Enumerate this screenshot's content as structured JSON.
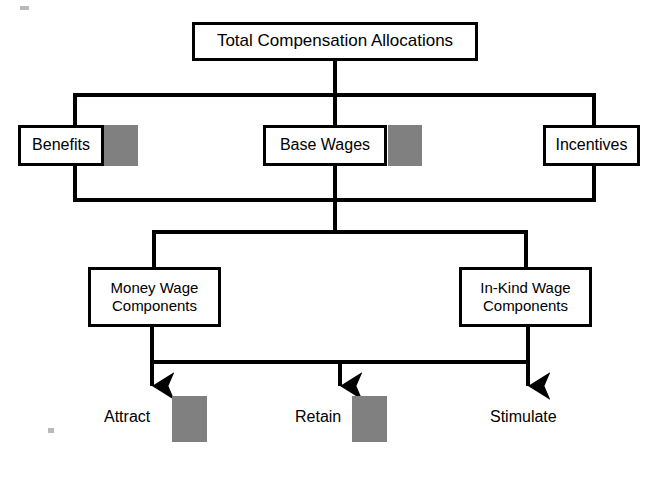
{
  "diagram": {
    "title": "Total Compensation Allocations",
    "type": "organizational-tree",
    "colors": {
      "line": "#000000",
      "box_fill": "#ffffff",
      "box_border": "#000000",
      "swatch_gray": "#808080",
      "page_background": "#ffffff"
    },
    "levels": [
      {
        "level": 1,
        "nodes": [
          {
            "id": "total-compensation-allocations",
            "label": "Total Compensation Allocations",
            "swatch": false,
            "x": 192,
            "y": 22,
            "w": 286,
            "h": 39,
            "font_size": 17
          }
        ]
      },
      {
        "level": 2,
        "nodes": [
          {
            "id": "benefits",
            "label": "Benefits",
            "swatch": true,
            "x": 18,
            "y": 125,
            "w": 86,
            "h": 41,
            "swatch_x": 104,
            "swatch_y": 125,
            "swatch_w": 34,
            "swatch_h": 41,
            "font_size": 16
          },
          {
            "id": "base-wages",
            "label": "Base Wages",
            "swatch": true,
            "x": 263,
            "y": 125,
            "w": 124,
            "h": 41,
            "swatch_x": 388,
            "swatch_y": 125,
            "swatch_w": 34,
            "swatch_h": 41,
            "font_size": 16
          },
          {
            "id": "incentives",
            "label": "Incentives",
            "swatch": false,
            "x": 543,
            "y": 125,
            "w": 97,
            "h": 41,
            "font_size": 16
          }
        ]
      },
      {
        "level": 3,
        "nodes": [
          {
            "id": "money-wage-components",
            "label": "Money Wage\nComponents",
            "swatch": false,
            "x": 88,
            "y": 267,
            "w": 133,
            "h": 60,
            "font_size": 15
          },
          {
            "id": "in-kind-wage-components",
            "label": "In-Kind Wage\nComponents",
            "swatch": false,
            "x": 459,
            "y": 267,
            "w": 133,
            "h": 60,
            "font_size": 15
          }
        ]
      }
    ],
    "outcomes": [
      {
        "id": "attract",
        "label": "Attract",
        "swatch": true,
        "label_x": 104,
        "label_y": 408,
        "swatch_x": 172,
        "swatch_y": 396,
        "swatch_w": 35,
        "swatch_h": 46,
        "arrow_x": 152,
        "font_size": 16
      },
      {
        "id": "retain",
        "label": "Retain",
        "swatch": true,
        "label_x": 295,
        "label_y": 408,
        "swatch_x": 352,
        "swatch_y": 396,
        "swatch_w": 35,
        "swatch_h": 46,
        "arrow_x": 340,
        "font_size": 16
      },
      {
        "id": "stimulate",
        "label": "Stimulate",
        "swatch": false,
        "label_x": 490,
        "label_y": 408,
        "arrow_x": 528,
        "font_size": 16
      }
    ],
    "connectors": {
      "root_stem": {
        "x": 335,
        "y1": 61,
        "y2": 95
      },
      "level2_bus_top": {
        "x1": 75,
        "x2": 594,
        "y": 95
      },
      "level2_drops": [
        {
          "x": 75,
          "y1": 95,
          "y2": 200
        },
        {
          "x": 335,
          "y1": 95,
          "y2": 200
        },
        {
          "x": 594,
          "y1": 95,
          "y2": 200
        }
      ],
      "level2_bus_bottom": {
        "x1": 75,
        "x2": 594,
        "y": 200
      },
      "level3_stem": {
        "x": 335,
        "y1": 200,
        "y2": 232
      },
      "level3_bus": {
        "x1": 154,
        "x2": 526,
        "y": 232
      },
      "level3_drops": [
        {
          "x": 154,
          "y1": 232,
          "y2": 267
        },
        {
          "x": 526,
          "y1": 232,
          "y2": 267
        }
      ],
      "outcome_risers": [
        {
          "x": 152,
          "y1": 327,
          "y2": 362
        },
        {
          "x": 528,
          "y1": 327,
          "y2": 362
        }
      ],
      "outcome_bus": {
        "x1": 152,
        "x2": 528,
        "y": 362
      },
      "arrow_tip_y": 398,
      "arrow_head_width": 13,
      "arrow_head_height": 17,
      "line_width": 4
    }
  }
}
